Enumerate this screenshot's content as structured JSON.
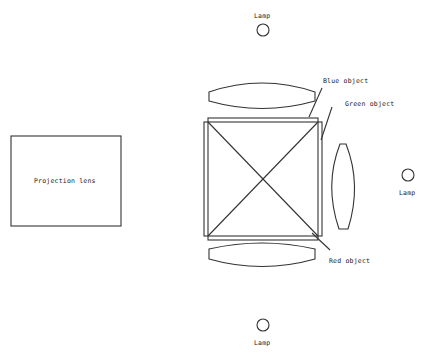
{
  "diagram": {
    "labels": {
      "lamp_top": "Lamp",
      "lamp_right": "Lamp",
      "lamp_bottom": "Lamp",
      "projection_lens": "Projection lens",
      "blue_object": "Blue object",
      "green_object": "Green object",
      "red_object": "Red object"
    },
    "colors": {
      "stroke": "#333333",
      "background": "#ffffff"
    }
  }
}
